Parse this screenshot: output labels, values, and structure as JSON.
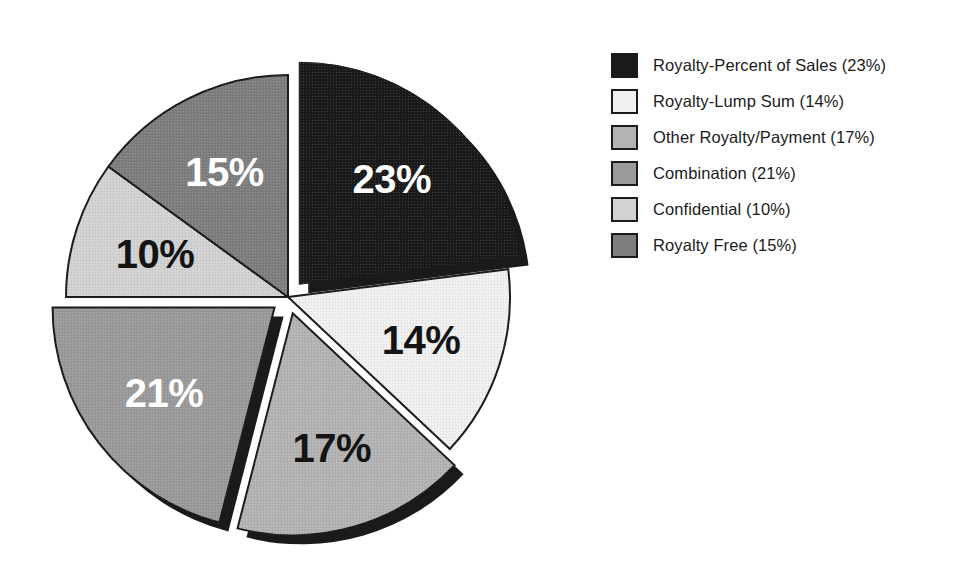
{
  "chart_data": {
    "type": "pie",
    "title": "",
    "subtitle": "",
    "xlabel": "",
    "ylabel": "",
    "grid": false,
    "legend_position": "right",
    "start_angle_deg": 0,
    "direction": "clockwise",
    "units": "percent",
    "total": 100,
    "categories": [
      "Royalty-Percent of Sales",
      "Royalty-Lump Sum",
      "Other Royalty/Payment",
      "Combination",
      "Confidential",
      "Royalty Free"
    ],
    "values": [
      23,
      14,
      17,
      21,
      10,
      15
    ],
    "slice_labels": [
      "23%",
      "14%",
      "17%",
      "21%",
      "10%",
      "15%"
    ],
    "slices": [
      {
        "name": "Royalty-Percent of Sales",
        "value": 23,
        "label": "23%",
        "legend_text": "Royalty-Percent of Sales (23%)",
        "fill": "#1a1a1a",
        "label_color": "#ffffff",
        "exploded": true
      },
      {
        "name": "Royalty-Lump Sum",
        "value": 14,
        "label": "14%",
        "legend_text": "Royalty-Lump Sum (14%)",
        "fill": "#f0f0f0",
        "label_color": "#141414",
        "exploded": false
      },
      {
        "name": "Other Royalty/Payment",
        "value": 17,
        "label": "17%",
        "legend_text": "Other Royalty/Payment (17%)",
        "fill": "#b3b3b3",
        "label_color": "#141414",
        "exploded": true
      },
      {
        "name": "Combination",
        "value": 21,
        "label": "21%",
        "legend_text": "Combination (21%)",
        "fill": "#9a9a9a",
        "label_color": "#ffffff",
        "exploded": true
      },
      {
        "name": "Confidential",
        "value": 10,
        "label": "10%",
        "legend_text": "Confidential (10%)",
        "fill": "#d2d2d2",
        "label_color": "#141414",
        "exploded": false
      },
      {
        "name": "Royalty Free",
        "value": 15,
        "label": "15%",
        "legend_text": "Royalty Free (15%)",
        "fill": "#7e7e7e",
        "label_color": "#ffffff",
        "exploded": false
      }
    ]
  },
  "legend": {
    "items": [
      {
        "label": "Royalty-Percent of Sales (23%)",
        "swatch": "#1a1a1a"
      },
      {
        "label": "Royalty-Lump Sum (14%)",
        "swatch": "#f0f0f0"
      },
      {
        "label": "Other Royalty/Payment (17%)",
        "swatch": "#b3b3b3"
      },
      {
        "label": "Combination (21%)",
        "swatch": "#9a9a9a"
      },
      {
        "label": "Confidential (10%)",
        "swatch": "#d2d2d2"
      },
      {
        "label": "Royalty Free (15%)",
        "swatch": "#7e7e7e"
      }
    ]
  },
  "colors": {
    "background": "#ffffff",
    "outline": "#1b1b1b",
    "shadow": "#1a1a1a",
    "label_light": "#ffffff",
    "label_dark": "#141414"
  }
}
